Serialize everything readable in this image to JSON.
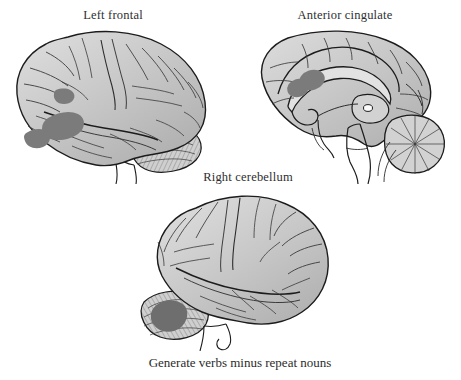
{
  "figure": {
    "background_color": "#ffffff",
    "caption": "Generate verbs minus repeat nouns",
    "labels": {
      "left_frontal": "Left frontal",
      "anterior_cingulate": "Anterior cingulate",
      "right_cerebellum": "Right cerebellum"
    },
    "colors": {
      "cortex_fill": "#c6c6c6",
      "cortex_fill_light": "#d6d6d6",
      "cortex_fill_dark": "#b4b4b4",
      "activation_blob": "#7b7b7b",
      "activation_blob_dark": "#6e6e6e",
      "outline": "#1c1c1c",
      "sulci": "#3a3a3a",
      "cerebellum_fill": "#cfcfcf",
      "text": "#2b2b2b"
    },
    "panels": [
      {
        "name": "left-lateral-view",
        "label": "Left frontal",
        "view": "left lateral surface",
        "orientation": "frontal pole at left, occipital pole at right",
        "activations": [
          {
            "region": "left inferior frontal gyrus",
            "shape": "irregular blob",
            "color": "#7b7b7b"
          },
          {
            "region": "left frontal operculum",
            "shape": "small blob",
            "color": "#7b7b7b"
          },
          {
            "region": "left middle frontal gyrus",
            "shape": "small blob",
            "color": "#7b7b7b"
          }
        ]
      },
      {
        "name": "midsagittal-view",
        "label": "Anterior cingulate",
        "view": "medial sagittal section",
        "orientation": "frontal pole at left, cerebellum at right",
        "activations": [
          {
            "region": "anterior cingulate cortex",
            "shape": "two overlapping ellipses",
            "color": "#7b7b7b"
          }
        ]
      },
      {
        "name": "right-lateral-view",
        "label": "Right cerebellum",
        "view": "right lateral surface",
        "orientation": "frontal pole at right, cerebellum at left",
        "activations": [
          {
            "region": "right cerebellar hemisphere",
            "shape": "oval blob",
            "color": "#6e6e6e"
          }
        ]
      }
    ]
  }
}
